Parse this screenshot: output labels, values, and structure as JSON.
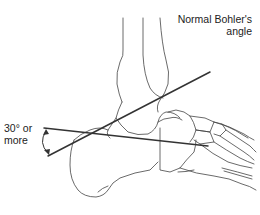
{
  "figure": {
    "title": {
      "line1": "Normal Bohler's",
      "line2": "angle"
    },
    "angle_annotation": {
      "line1": "30° or",
      "line2": "more"
    },
    "colors": {
      "background": "#ffffff",
      "bone_outline": "#333333",
      "reference_lines": "#333333",
      "text": "#222222"
    },
    "elements": [
      "tibia",
      "fibula",
      "talus",
      "calcaneus",
      "navicular",
      "cuboid",
      "cuneiforms",
      "metatarsals",
      "reference-line-upper",
      "reference-line-lower",
      "angle-arc-arrow"
    ]
  }
}
